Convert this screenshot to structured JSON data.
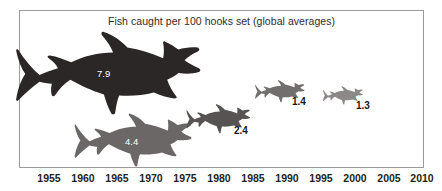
{
  "chart_data": {
    "type": "bar",
    "title": "Fish caught per 100 hooks set (global averages)",
    "xlabel": "",
    "ylabel": "",
    "units": "fish caught per 100 hooks set",
    "note": "Pictorial chart: fish silhouettes sized proportionally to the catch rate",
    "grid": false,
    "legend": "none",
    "xlim": [
      1955,
      2010
    ],
    "x_ticks": [
      1955,
      1960,
      1965,
      1970,
      1975,
      1980,
      1985,
      1990,
      1995,
      2000,
      2005,
      2010
    ],
    "categories": [
      "1955",
      "1965",
      "1980",
      "1990",
      "2000"
    ],
    "values": [
      7.9,
      4.4,
      2.4,
      1.4,
      1.3
    ],
    "labels": [
      "7.9",
      "4.4",
      "2.4",
      "1.4",
      "1.3"
    ],
    "series": [
      {
        "name": "Fish caught per 100 hooks set",
        "points": [
          {
            "year": 1955,
            "value": 7.9,
            "label": "7.9",
            "label_placement": "inside",
            "label_color": "#ffffff",
            "fish_color": "#2b2727"
          },
          {
            "year": 1965,
            "value": 4.4,
            "label": "4.4",
            "label_placement": "inside",
            "label_color": "#ffffff",
            "fish_color": "#6a6766"
          },
          {
            "year": 1980,
            "value": 2.4,
            "label": "2.4",
            "label_placement": "outside",
            "label_color": "#1a1a1a",
            "fish_color": "#565352"
          },
          {
            "year": 1990,
            "value": 1.4,
            "label": "1.4",
            "label_placement": "outside",
            "label_color": "#1a1a1a",
            "fish_color": "#716e6d"
          },
          {
            "year": 2000,
            "value": 1.3,
            "label": "1.3",
            "label_placement": "outside",
            "label_color": "#1a1a1a",
            "fish_color": "#8b8887"
          }
        ]
      }
    ],
    "colors": {
      "frame": "#9b9b9b",
      "background": "#ffffff",
      "title": "#2e2b2c",
      "axis_text": "#231f20"
    }
  },
  "axis": {
    "ticks": [
      {
        "label": "1955",
        "x": 49
      },
      {
        "label": "1960",
        "x": 83
      },
      {
        "label": "1965",
        "x": 117
      },
      {
        "label": "1970",
        "x": 151
      },
      {
        "label": "1975",
        "x": 185
      },
      {
        "label": "1980",
        "x": 219
      },
      {
        "label": "1985",
        "x": 253
      },
      {
        "label": "1990",
        "x": 287
      },
      {
        "label": "1995",
        "x": 321
      },
      {
        "label": "2000",
        "x": 355
      },
      {
        "label": "2005",
        "x": 389
      },
      {
        "label": "2010",
        "x": 422
      }
    ]
  },
  "fish": [
    {
      "name": "fish-1955",
      "label": "7.9",
      "left": 12,
      "top": 31,
      "width": 194,
      "height": 86,
      "color": "#2b2727",
      "label_left": 97,
      "label_top": 68,
      "placement": "inside"
    },
    {
      "name": "fish-1965",
      "label": "4.4",
      "left": 72,
      "top": 113,
      "width": 123,
      "height": 55,
      "color": "#6a6766",
      "label_left": 125,
      "label_top": 136,
      "placement": "inside"
    },
    {
      "name": "fish-1980",
      "label": "2.4",
      "left": 185,
      "top": 104,
      "width": 67,
      "height": 30,
      "color": "#565352",
      "label_left": 234,
      "label_top": 125,
      "placement": "outside"
    },
    {
      "name": "fish-1990",
      "label": "1.4",
      "left": 254,
      "top": 80,
      "width": 52,
      "height": 23,
      "color": "#716e6d",
      "label_left": 292,
      "label_top": 96,
      "placement": "outside"
    },
    {
      "name": "fish-2000",
      "label": "1.3",
      "left": 322,
      "top": 86,
      "width": 42,
      "height": 19,
      "color": "#8b8887",
      "label_left": 356,
      "label_top": 100,
      "placement": "outside"
    }
  ],
  "title": {
    "text": "Fish caught per 100 hooks set (global averages)"
  }
}
